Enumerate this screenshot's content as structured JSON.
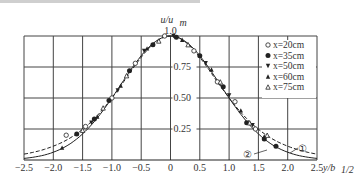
{
  "chart_data": {
    "type": "scatter",
    "title": "",
    "xlabel": "y/b1/2",
    "ylabel": "u/um",
    "xlim": [
      -2.5,
      2.5
    ],
    "ylim": [
      0,
      1.0
    ],
    "grid": true,
    "legend_position": "upper right",
    "x_ticks": [
      "-2.5",
      "-2.0",
      "-1.5",
      "-1.0",
      "-0.5",
      "0",
      "0.5",
      "1.0",
      "1.5",
      "2.0",
      "2.5"
    ],
    "y_ticks": [
      "0.25",
      "0.50",
      "0.75",
      "1.0"
    ],
    "series": [
      {
        "name": "x=20cm",
        "marker": "open-circle",
        "points": [
          [
            -1.78,
            0.2
          ],
          [
            -1.45,
            0.27
          ],
          [
            -1.0,
            0.5
          ],
          [
            -0.6,
            0.78
          ],
          [
            -0.1,
            1.0
          ],
          [
            0.4,
            0.88
          ],
          [
            0.8,
            0.63
          ],
          [
            1.1,
            0.47
          ],
          [
            1.45,
            0.25
          ]
        ]
      },
      {
        "name": "x=35cm",
        "marker": "filled-circle",
        "points": [
          [
            -1.6,
            0.21
          ],
          [
            -1.3,
            0.33
          ],
          [
            -1.05,
            0.48
          ],
          [
            -0.7,
            0.72
          ],
          [
            -0.3,
            0.93
          ],
          [
            0.1,
            0.99
          ],
          [
            0.5,
            0.84
          ],
          [
            0.9,
            0.59
          ],
          [
            1.3,
            0.3
          ],
          [
            1.6,
            0.17
          ],
          [
            1.8,
            0.11
          ]
        ]
      },
      {
        "name": "x=50cm",
        "marker": "filled-down-triangle",
        "points": [
          [
            -1.35,
            0.3
          ],
          [
            -0.9,
            0.56
          ],
          [
            -0.45,
            0.88
          ],
          [
            0.05,
            1.0
          ],
          [
            0.6,
            0.78
          ],
          [
            1.0,
            0.52
          ],
          [
            1.4,
            0.28
          ]
        ]
      },
      {
        "name": "x=60cm",
        "marker": "filled-triangle",
        "points": [
          [
            -1.85,
            0.1
          ],
          [
            -1.25,
            0.35
          ],
          [
            -0.85,
            0.6
          ],
          [
            -0.4,
            0.9
          ],
          [
            0.2,
            0.97
          ],
          [
            0.7,
            0.73
          ],
          [
            1.2,
            0.4
          ],
          [
            1.6,
            0.19
          ]
        ]
      },
      {
        "name": "x=75cm",
        "marker": "open-triangle",
        "points": [
          [
            -1.5,
            0.24
          ],
          [
            -1.15,
            0.42
          ],
          [
            -0.75,
            0.68
          ],
          [
            -0.2,
            0.96
          ],
          [
            0.3,
            0.93
          ],
          [
            0.85,
            0.63
          ],
          [
            1.35,
            0.3
          ],
          [
            1.65,
            0.2
          ]
        ]
      }
    ],
    "curves": [
      {
        "name": "①",
        "style": "dashed",
        "description": "theoretical curve 1 (higher tail)"
      },
      {
        "name": "②",
        "style": "solid",
        "description": "theoretical curve 2 (Gaussian)"
      }
    ]
  },
  "axis": {
    "ylabel_top": "u/u",
    "ylabel_sub": "m",
    "xlabel_main": "y/b",
    "xlabel_sub": "1/2"
  },
  "legend": [
    {
      "label": "x=20cm"
    },
    {
      "label": "x=35cm"
    },
    {
      "label": "x=50cm"
    },
    {
      "label": "x=60cm"
    },
    {
      "label": "x=75cm"
    }
  ],
  "annotations": {
    "curve1": "①",
    "curve2": "②"
  }
}
